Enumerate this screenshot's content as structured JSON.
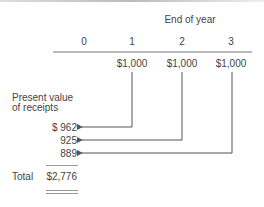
{
  "header": {
    "title": "End of year"
  },
  "years": [
    "0",
    "1",
    "2",
    "3"
  ],
  "receipts": [
    "$1,000",
    "$1,000",
    "$1,000"
  ],
  "present_value": {
    "label_line1": "Present value",
    "label_line2": "of receipts",
    "values": [
      "$  962",
      "925",
      "889"
    ]
  },
  "total": {
    "label": "Total",
    "value": "$2,776"
  }
}
